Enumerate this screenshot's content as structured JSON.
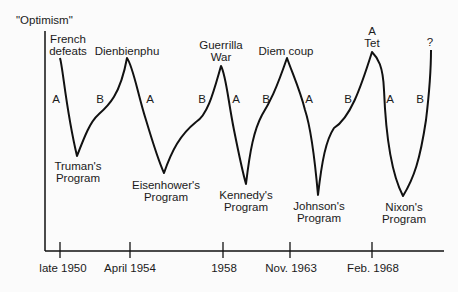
{
  "diagram": {
    "y_axis_label": "\"Optimism\"",
    "x_axis_ticks": [
      {
        "label": "late 1950",
        "x": 60
      },
      {
        "label": "April 1954",
        "x": 130
      },
      {
        "label": "1958",
        "x": 223
      },
      {
        "label": "Nov. 1963",
        "x": 290
      },
      {
        "label": "Feb. 1968",
        "x": 372
      }
    ],
    "peaks": [
      {
        "label_line1": "French",
        "label_line2": "defeats"
      },
      {
        "label_line1": "Dienbienphu"
      },
      {
        "label_line1": "Guerrilla",
        "label_line2": "War"
      },
      {
        "label_line1": "Diem coup"
      },
      {
        "label_line1": "A",
        "label_line2": "Tet"
      },
      {
        "label_line1": "?"
      }
    ],
    "troughs": [
      {
        "label_line1": "Truman's",
        "label_line2": "Program"
      },
      {
        "label_line1": "Eisenhower's",
        "label_line2": "Program"
      },
      {
        "label_line1": "Kennedy's",
        "label_line2": "Program"
      },
      {
        "label_line1": "Johnson's",
        "label_line2": "Program"
      },
      {
        "label_line1": "Nixon's",
        "label_line2": "Program"
      }
    ],
    "phase_labels": [
      "A",
      "B",
      "A",
      "B",
      "A",
      "B",
      "A",
      "B",
      "A",
      "B"
    ],
    "line_color": "#111111"
  }
}
